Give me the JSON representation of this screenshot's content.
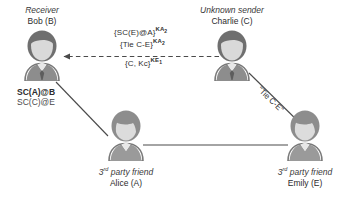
{
  "diagram": {
    "title_bob_role": "Receiver",
    "title_bob_name": "Bob (B)",
    "title_charlie_role": "Unknown sender",
    "title_charlie_name": "Charlie (C)",
    "alice_role_prefix": "3",
    "alice_role_sup": "rd",
    "alice_role_suffix": " party friend",
    "alice_name": "Alice (A)",
    "emily_role_prefix": "3",
    "emily_role_sup": "rd",
    "emily_role_suffix": " party friend",
    "emily_name": "Emily (E)",
    "message_line1_main": "{SC(E)@A}",
    "message_line1_sup": "KA",
    "message_line1_sup_sub": "2",
    "message_line2_main": "{Tie C-E}",
    "message_line2_sup": "KA",
    "message_line2_sup_sub": "2",
    "message_line3_main": "{C, Kc}",
    "message_line3_sup": "KE",
    "message_line3_sup_sub": "1",
    "bob_trust_bold": "SC(A)@B",
    "bob_trust_thin": "SC(C)@E",
    "tie_ce_label": "\"Tie C-E\"",
    "colors": {
      "hair_dark": "#6f6f6f",
      "hair_mid": "#8d8d8d",
      "face": "#d6d6d6",
      "body": "#cfcfcf",
      "line": "#555555",
      "text": "#2b2b2b"
    }
  }
}
